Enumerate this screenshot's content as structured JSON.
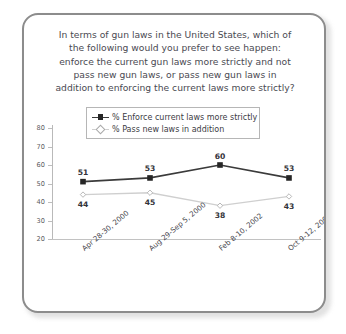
{
  "card": {
    "border_color": "#8c8c8c",
    "background": "#ffffff"
  },
  "title": {
    "lines": [
      "In terms of gun laws in the United States, which of",
      "the following would you prefer to see happen:",
      "enforce the current gun laws more strictly and not",
      "pass new gun laws, or pass new gun laws in",
      "addition to enforcing the current laws more strictly?"
    ]
  },
  "legend": {
    "entries": [
      {
        "label": "% Enforce current laws more strictly",
        "marker": "filled-square-icon",
        "color": "#262626"
      },
      {
        "label": "% Pass new laws in addition",
        "marker": "open-diamond-icon",
        "color": "#cfcfcf"
      }
    ]
  },
  "chart_data": {
    "type": "line",
    "xlabel": "",
    "ylabel": "",
    "ylim": [
      20,
      80
    ],
    "yticks": [
      20,
      30,
      40,
      50,
      60,
      70,
      80
    ],
    "grid": false,
    "legend_position": "top-center",
    "categories": [
      "Apr 28-30, 2000",
      "Aug 29-Sep 5, 2000",
      "Feb 8-10, 2002",
      "Oct 9-12, 2006"
    ],
    "series": [
      {
        "name": "% Enforce current laws more strictly",
        "color": "#3b3b3b",
        "marker": "filled-square",
        "values": [
          51,
          53,
          60,
          53
        ],
        "label_position": "above"
      },
      {
        "name": "% Pass new laws in addition",
        "color": "#cfcfcf",
        "marker": "open-diamond",
        "values": [
          44,
          45,
          38,
          43
        ],
        "label_position": "below"
      }
    ]
  }
}
